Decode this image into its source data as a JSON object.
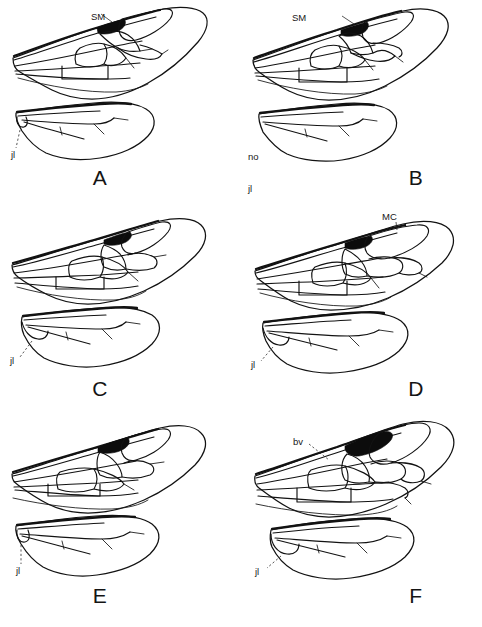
{
  "figure": {
    "type": "scientific-illustration-plate",
    "panel_count": 6,
    "grid": "2 columns x 3 rows",
    "background_color": "#ffffff",
    "ink_color": "#121212"
  },
  "panels": [
    {
      "id": "A",
      "letter": "A",
      "row": 0,
      "col": 0,
      "forewing": {
        "stigma": "dark pterostigma present",
        "submarginal_cells": 2,
        "labels": [
          {
            "name": "sm-label",
            "text": "SM",
            "leader": "solid",
            "points_to": "submarginal cell"
          }
        ]
      },
      "hindwing": {
        "jugal_lobe": "present",
        "labels": [
          {
            "name": "jl-label",
            "text": "jl",
            "leader": "dashed-vertical",
            "points_to": "jugal lobe"
          }
        ]
      }
    },
    {
      "id": "B",
      "letter": "B",
      "row": 0,
      "col": 1,
      "forewing": {
        "stigma": "dark pterostigma present",
        "submarginal_cells": 3,
        "labels": [
          {
            "name": "sm-label",
            "text": "SM",
            "leader": "solid",
            "points_to": "submarginal cell"
          }
        ]
      },
      "hindwing": {
        "jugal_lobe": "absent",
        "labels": [
          {
            "name": "no-jl-label",
            "text": "no\njl",
            "line1": "no",
            "line2": "jl",
            "leader": "none",
            "points_to": "absent jugal lobe"
          }
        ]
      }
    },
    {
      "id": "C",
      "letter": "C",
      "row": 1,
      "col": 0,
      "forewing": {
        "stigma": "dark pterostigma present",
        "submarginal_cells": 2,
        "labels": []
      },
      "hindwing": {
        "jugal_lobe": "present",
        "labels": [
          {
            "name": "jl-label",
            "text": "jl",
            "leader": "dashed",
            "points_to": "jugal lobe"
          }
        ]
      }
    },
    {
      "id": "D",
      "letter": "D",
      "row": 1,
      "col": 1,
      "forewing": {
        "stigma": "dark pterostigma present",
        "submarginal_cells": 2,
        "labels": [
          {
            "name": "mc-label",
            "text": "MC",
            "leader": "short",
            "points_to": "marginal cell"
          }
        ]
      },
      "hindwing": {
        "jugal_lobe": "present",
        "labels": [
          {
            "name": "jl-label",
            "text": "jl",
            "leader": "dashed",
            "points_to": "jugal lobe"
          }
        ]
      }
    },
    {
      "id": "E",
      "letter": "E",
      "row": 2,
      "col": 0,
      "forewing": {
        "stigma": "dark pterostigma present",
        "submarginal_cells": 2,
        "labels": []
      },
      "hindwing": {
        "jugal_lobe": "present",
        "labels": [
          {
            "name": "jl-label",
            "text": "jl",
            "leader": "dashed-vertical",
            "points_to": "jugal lobe"
          }
        ]
      }
    },
    {
      "id": "F",
      "letter": "F",
      "row": 2,
      "col": 1,
      "forewing": {
        "stigma": "large dark pterostigma present",
        "submarginal_cells": 3,
        "labels": [
          {
            "name": "bv-label",
            "text": "bv",
            "leader": "dashed",
            "points_to": "basal vein"
          }
        ]
      },
      "hindwing": {
        "jugal_lobe": "present",
        "labels": [
          {
            "name": "jl-label",
            "text": "jl",
            "leader": "dashed",
            "points_to": "jugal lobe"
          }
        ]
      }
    }
  ],
  "abbreviations": {
    "SM": "submarginal cell",
    "MC": "marginal cell",
    "bv": "basal vein",
    "jl": "jugal lobe",
    "no jl": "no jugal lobe"
  }
}
